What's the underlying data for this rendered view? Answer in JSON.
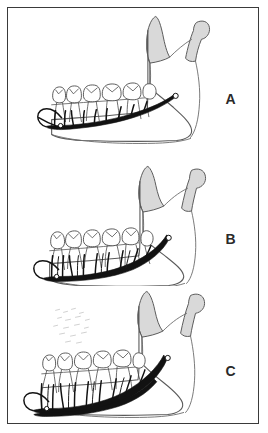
{
  "figure": {
    "border_color": "#3a3a3a",
    "background_color": "#ffffff",
    "panel_count": 3
  },
  "panels": [
    {
      "id": "panel-a",
      "letter": "A",
      "letter_name": "panel-label-a",
      "description": "Lateral view of mandible with thick inferior alveolar nerve running along the body, fine branches ascending to tooth roots, mental foramen at anterior, shaded coronoid process and condyle",
      "features": {
        "nerve_label": "inferior alveolar nerve",
        "foramen_label": "mandibular foramen",
        "mental_foramen_label": "mental foramen",
        "coronoid_label": "coronoid process",
        "condyle_label": "condyle",
        "ramus_label": "ramus",
        "body_label": "body of mandible",
        "teeth_count": 6
      }
    },
    {
      "id": "panel-b",
      "letter": "B",
      "letter_name": "panel-label-b",
      "description": "Lateral view of mandible, nerve positioned lower in body with numerous branches to roots of teeth; shaded coronoid process and condyle",
      "features": {
        "nerve_label": "inferior alveolar nerve",
        "foramen_label": "mandibular foramen",
        "mental_foramen_label": "mental foramen",
        "coronoid_label": "coronoid process",
        "condyle_label": "condyle",
        "ramus_label": "ramus",
        "body_label": "body of mandible",
        "teeth_count": 6
      }
    },
    {
      "id": "panel-c",
      "letter": "C",
      "letter_name": "panel-label-c",
      "description": "Lateral view of resorbed mandible, nerve low and close to inferior border with branches to tooth roots; shaded coronoid process and condyle",
      "features": {
        "nerve_label": "inferior alveolar nerve",
        "foramen_label": "mandibular foramen",
        "mental_foramen_label": "mental foramen",
        "coronoid_label": "coronoid process",
        "condyle_label": "condyle",
        "ramus_label": "ramus",
        "body_label": "body of mandible",
        "teeth_count": 6
      }
    }
  ],
  "colors": {
    "bone_outline": "#5a5a5a",
    "bone_shade": "#d9d9d9",
    "nerve": "#121212",
    "tooth_outline": "#4a4a4a",
    "label_text": "#2a2a2a"
  }
}
